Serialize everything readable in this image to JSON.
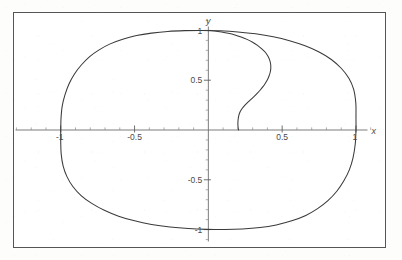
{
  "figure": {
    "kind": "parametric-plot",
    "background_color": "#fdfdfb",
    "frame_color": "#555555",
    "curve_color": "#3a3a3a",
    "axis_color": "#6e6e6e",
    "tick_label_color": "#4a4a4a"
  },
  "chart_data": {
    "type": "line",
    "title": "",
    "xlabel": "x",
    "ylabel": "y",
    "xlim": [
      -1.32,
      1.2
    ],
    "ylim": [
      -1.18,
      1.18
    ],
    "grid": false,
    "legend": "none",
    "frame": true,
    "axes_at_origin": true,
    "x_ticks": [
      -1,
      -0.5,
      0.5,
      1
    ],
    "x_tick_labels": [
      "-1",
      "-0.5",
      "0.5",
      "1"
    ],
    "y_ticks": [
      -1,
      -0.5,
      0.5,
      1
    ],
    "y_tick_labels": [
      "-1",
      "-0.5",
      "0.5",
      "1"
    ],
    "x_minor_tick_step": 0.1,
    "y_minor_tick_step": 0.1,
    "series": [
      {
        "name": "outer-closed-curve",
        "closed": true,
        "points": [
          [
            -1.0,
            0.0
          ],
          [
            -0.998,
            0.12
          ],
          [
            -0.99,
            0.24
          ],
          [
            -0.972,
            0.35
          ],
          [
            -0.945,
            0.46
          ],
          [
            -0.908,
            0.56
          ],
          [
            -0.862,
            0.65
          ],
          [
            -0.806,
            0.735
          ],
          [
            -0.74,
            0.805
          ],
          [
            -0.665,
            0.865
          ],
          [
            -0.58,
            0.912
          ],
          [
            -0.487,
            0.948
          ],
          [
            -0.385,
            0.973
          ],
          [
            -0.275,
            0.99
          ],
          [
            -0.16,
            0.998
          ],
          [
            -0.04,
            1.0
          ],
          [
            0.08,
            0.996
          ],
          [
            0.2,
            0.985
          ],
          [
            0.32,
            0.966
          ],
          [
            0.44,
            0.936
          ],
          [
            0.55,
            0.896
          ],
          [
            0.655,
            0.845
          ],
          [
            0.75,
            0.783
          ],
          [
            0.833,
            0.708
          ],
          [
            0.9,
            0.62
          ],
          [
            0.952,
            0.52
          ],
          [
            0.984,
            0.41
          ],
          [
            0.999,
            0.27
          ],
          [
            1.0,
            0.13
          ],
          [
            1.0,
            0.0
          ],
          [
            0.995,
            -0.14
          ],
          [
            0.98,
            -0.28
          ],
          [
            0.955,
            -0.4
          ],
          [
            0.918,
            -0.51
          ],
          [
            0.87,
            -0.615
          ],
          [
            0.81,
            -0.71
          ],
          [
            0.74,
            -0.79
          ],
          [
            0.66,
            -0.858
          ],
          [
            0.565,
            -0.912
          ],
          [
            0.46,
            -0.953
          ],
          [
            0.35,
            -0.98
          ],
          [
            0.23,
            -0.995
          ],
          [
            0.11,
            -1.0
          ],
          [
            -0.01,
            -0.998
          ],
          [
            -0.135,
            -0.99
          ],
          [
            -0.26,
            -0.974
          ],
          [
            -0.385,
            -0.948
          ],
          [
            -0.5,
            -0.912
          ],
          [
            -0.608,
            -0.865
          ],
          [
            -0.705,
            -0.806
          ],
          [
            -0.79,
            -0.737
          ],
          [
            -0.862,
            -0.658
          ],
          [
            -0.918,
            -0.567
          ],
          [
            -0.958,
            -0.468
          ],
          [
            -0.984,
            -0.36
          ],
          [
            -0.997,
            -0.24
          ],
          [
            -1.0,
            -0.12
          ],
          [
            -1.0,
            0.0
          ]
        ]
      },
      {
        "name": "inner-arc",
        "closed": false,
        "points": [
          [
            0.0,
            1.0
          ],
          [
            0.045,
            0.995
          ],
          [
            0.09,
            0.985
          ],
          [
            0.135,
            0.972
          ],
          [
            0.18,
            0.955
          ],
          [
            0.222,
            0.934
          ],
          [
            0.262,
            0.91
          ],
          [
            0.3,
            0.882
          ],
          [
            0.333,
            0.85
          ],
          [
            0.362,
            0.815
          ],
          [
            0.387,
            0.778
          ],
          [
            0.404,
            0.74
          ],
          [
            0.416,
            0.7
          ],
          [
            0.422,
            0.66
          ],
          [
            0.423,
            0.62
          ],
          [
            0.419,
            0.58
          ],
          [
            0.411,
            0.542
          ],
          [
            0.4,
            0.505
          ],
          [
            0.386,
            0.47
          ],
          [
            0.37,
            0.435
          ],
          [
            0.352,
            0.402
          ],
          [
            0.332,
            0.37
          ],
          [
            0.312,
            0.34
          ],
          [
            0.29,
            0.31
          ],
          [
            0.268,
            0.28
          ],
          [
            0.248,
            0.25
          ],
          [
            0.23,
            0.218
          ],
          [
            0.216,
            0.185
          ],
          [
            0.207,
            0.15
          ],
          [
            0.202,
            0.11
          ],
          [
            0.2,
            0.065
          ],
          [
            0.202,
            0.02
          ],
          [
            0.205,
            0.0
          ]
        ]
      }
    ]
  },
  "labels": {
    "x_axis": "x",
    "y_axis": "y",
    "x_neg_one": "-1",
    "x_neg_half": "-0.5",
    "x_pos_half": "0.5",
    "x_pos_one": "1",
    "y_pos_one": "1",
    "y_pos_half": "0.5",
    "y_neg_half": "-0.5",
    "y_neg_one": "-1"
  }
}
